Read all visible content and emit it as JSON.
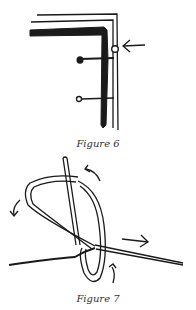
{
  "figures": [
    {
      "id": "figure-6",
      "caption": "Figure 6",
      "description": "Corner of a fabric edge with two pins and a small loop stitch indicated by an arrow"
    },
    {
      "id": "figure-7",
      "caption": "Figure 7",
      "description": "Needle passing through a thread loop forming a knot, with directional arrows"
    }
  ],
  "colors": {
    "ink": "#1a1a1a",
    "background": "#ffffff"
  }
}
